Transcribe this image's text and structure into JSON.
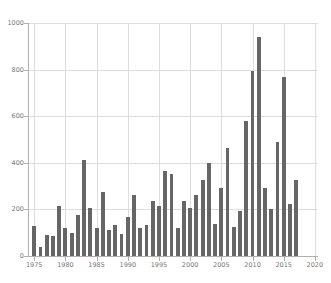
{
  "chart_data": {
    "type": "bar",
    "title": "",
    "subtitle": "",
    "xlabel": "",
    "ylabel": "",
    "xlim": [
      1974,
      2020.5
    ],
    "ylim": [
      0,
      1000
    ],
    "grid": true,
    "legend": null,
    "bar_color": "#666666",
    "grid_color": "#dddddd",
    "axis_color": "#b0b0b0",
    "tick_label_color": "#777777",
    "x_ticks": [
      1975,
      1980,
      1985,
      1990,
      1995,
      2000,
      2005,
      2010,
      2015,
      2020
    ],
    "x_tick_labels": [
      "1975",
      "1980",
      "1985",
      "1990",
      "1995",
      "2000",
      "2005",
      "2010",
      "2015",
      "2020"
    ],
    "y_ticks": [
      0,
      200,
      400,
      600,
      800,
      1000
    ],
    "y_tick_labels": [
      "0",
      "200",
      "400",
      "600",
      "800",
      "1000"
    ],
    "categories": [
      1975,
      1976,
      1977,
      1978,
      1979,
      1980,
      1981,
      1982,
      1983,
      1984,
      1985,
      1986,
      1987,
      1988,
      1989,
      1990,
      1991,
      1992,
      1993,
      1994,
      1995,
      1996,
      1997,
      1998,
      1999,
      2000,
      2001,
      2002,
      2003,
      2004,
      2005,
      2006,
      2007,
      2008,
      2009,
      2010,
      2011,
      2012,
      2013,
      2014,
      2015,
      2016,
      2017
    ],
    "values": [
      128,
      40,
      92,
      86,
      213,
      119,
      98,
      178,
      411,
      206,
      122,
      273,
      112,
      132,
      94,
      166,
      263,
      119,
      135,
      236,
      214,
      367,
      353,
      121,
      236,
      204,
      263,
      327,
      399,
      139,
      290,
      464,
      124,
      193,
      580,
      795,
      940,
      290,
      203,
      490,
      767,
      222,
      326
    ]
  }
}
